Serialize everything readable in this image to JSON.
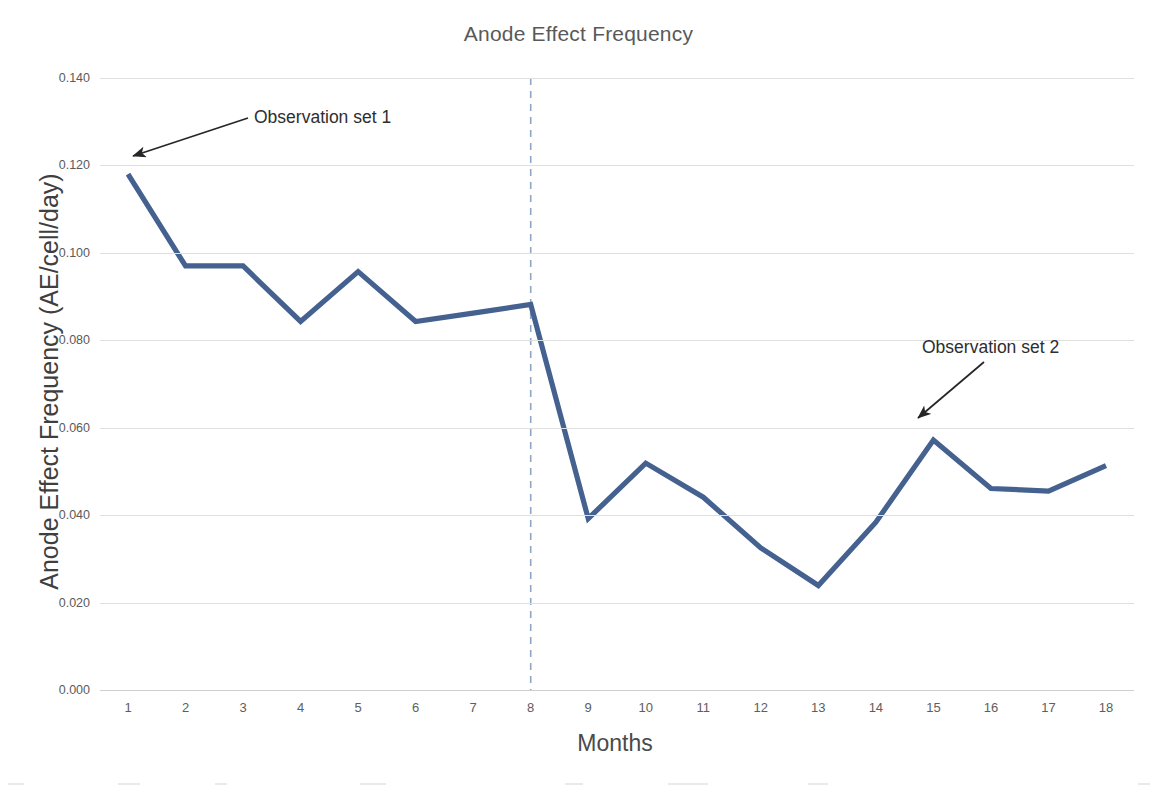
{
  "chart_data": {
    "type": "line",
    "title": "Anode Effect Frequency",
    "xlabel": "Months",
    "ylabel": "Anode Effect Frequency (AE/cell/day)",
    "categories": [
      "1",
      "2",
      "3",
      "4",
      "5",
      "6",
      "7",
      "8",
      "9",
      "10",
      "11",
      "12",
      "13",
      "14",
      "15",
      "16",
      "17",
      "18"
    ],
    "x": [
      1,
      2,
      3,
      4,
      5,
      6,
      7,
      8,
      9,
      10,
      11,
      12,
      13,
      14,
      15,
      16,
      17,
      18
    ],
    "values": [
      0.118,
      0.097,
      0.097,
      0.0843,
      0.0957,
      0.0843,
      0.0862,
      0.0882,
      0.0392,
      0.0519,
      0.0441,
      0.0325,
      0.0239,
      0.0384,
      0.0572,
      0.0461,
      0.0455,
      0.0513
    ],
    "series": [
      {
        "name": "Anode Effect Frequency",
        "color": "#44618f",
        "values": [
          0.118,
          0.097,
          0.097,
          0.0843,
          0.0957,
          0.0843,
          0.0862,
          0.0882,
          0.0392,
          0.0519,
          0.0441,
          0.0325,
          0.0239,
          0.0384,
          0.0572,
          0.0461,
          0.0455,
          0.0513
        ]
      }
    ],
    "ylim": [
      0.0,
      0.14
    ],
    "xlim": [
      1,
      18
    ],
    "yticks": [
      0.0,
      0.02,
      0.04,
      0.06,
      0.08,
      0.1,
      0.12,
      0.14
    ],
    "ytick_labels": [
      "0.000",
      "0.020",
      "0.040",
      "0.060",
      "0.080",
      "0.100",
      "0.120",
      "0.140"
    ],
    "grid": "horizontal",
    "legend": "none",
    "annotations": [
      {
        "id": "observation-set-1",
        "text": "Observation set 1",
        "points_to_x": 1,
        "points_to_y": 0.118
      },
      {
        "id": "observation-set-2",
        "text": "Observation set 2",
        "points_to_x": 15,
        "points_to_y": 0.0572
      }
    ],
    "reference_lines": [
      {
        "id": "observation-split",
        "orientation": "vertical",
        "x": 8,
        "style": "dashed",
        "color": "#8fa6c4"
      }
    ]
  },
  "colors": {
    "series": "#44618f",
    "gridline": "#dfdfdf",
    "divider": "#8fa6c4",
    "title_text": "#595959",
    "axis_text": "#5a5a5a",
    "annotation_text": "#2e2e2e"
  }
}
